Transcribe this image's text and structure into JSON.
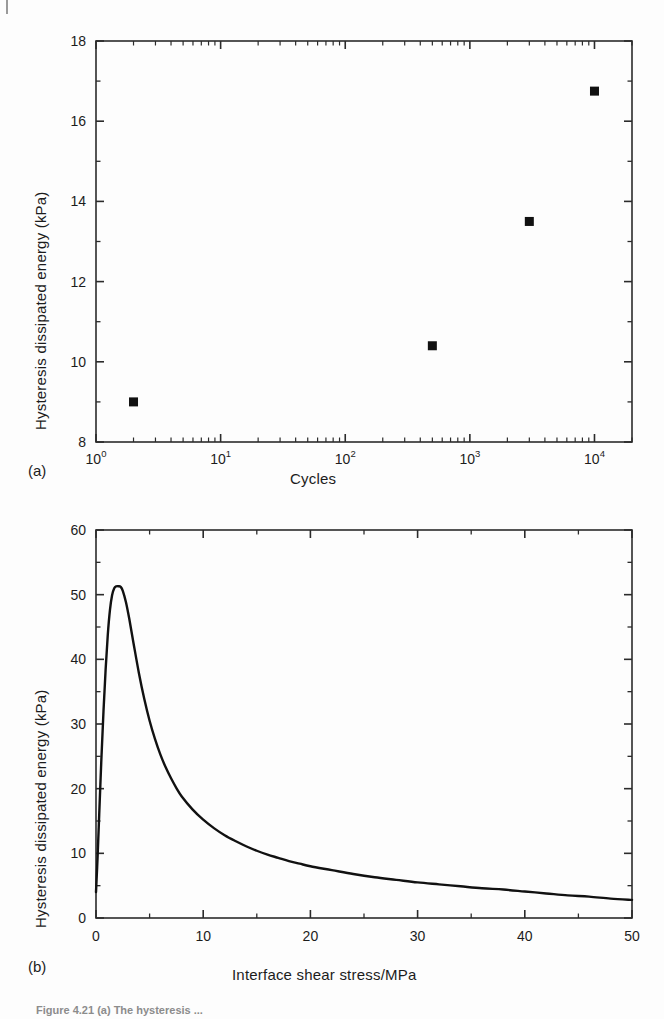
{
  "figure": {
    "caption_text": "Figure 4.21  (a) The hysteresis ...",
    "panel_a_letter": "(a)",
    "panel_b_letter": "(b)"
  },
  "chart_data": [
    {
      "type": "scatter",
      "panel": "(a)",
      "title": "",
      "xlabel": "Cycles",
      "ylabel": "Hysteresis dissipated energy (kPa)",
      "xscale": "log",
      "xlim": [
        1,
        20000
      ],
      "ylim": [
        8,
        18
      ],
      "yticks": [
        8,
        10,
        12,
        14,
        16,
        18
      ],
      "ytick_labels": [
        "8",
        "10",
        "12",
        "14",
        "16",
        "18"
      ],
      "xticks": [
        1,
        10,
        100,
        1000,
        10000
      ],
      "xtick_labels": [
        "10^0",
        "10^1",
        "10^2",
        "10^3",
        "10^4"
      ],
      "xtick_mantissa": [
        "10",
        "10",
        "10",
        "10",
        "10"
      ],
      "xtick_exponent": [
        "0",
        "1",
        "2",
        "3",
        "4"
      ],
      "grid": false,
      "legend": "none",
      "marker": "square",
      "marker_color": "#111111",
      "marker_size": 9,
      "points": [
        {
          "x": 2,
          "y": 9.0
        },
        {
          "x": 500,
          "y": 10.4
        },
        {
          "x": 3000,
          "y": 13.5
        },
        {
          "x": 10000,
          "y": 16.75
        }
      ]
    },
    {
      "type": "line",
      "panel": "(b)",
      "title": "",
      "xlabel": "Interface shear stress/MPa",
      "ylabel": "Hysteresis dissipated energy (kPa)",
      "xscale": "linear",
      "xlim": [
        0,
        50
      ],
      "ylim": [
        0,
        60
      ],
      "yticks": [
        0,
        10,
        20,
        30,
        40,
        50,
        60
      ],
      "ytick_labels": [
        "0",
        "10",
        "20",
        "30",
        "40",
        "50",
        "60"
      ],
      "xticks": [
        0,
        10,
        20,
        30,
        40,
        50
      ],
      "xtick_labels": [
        "0",
        "10",
        "20",
        "30",
        "40",
        "50"
      ],
      "grid": false,
      "legend": "none",
      "line_color": "#111111",
      "line_width": 2.4,
      "peak": {
        "x": 2.3,
        "y": 51.3
      },
      "series": [
        {
          "name": "hysteresis dissipated energy",
          "x": [
            0.0,
            0.15,
            0.3,
            0.5,
            0.7,
            0.9,
            1.1,
            1.3,
            1.5,
            1.7,
            1.9,
            2.1,
            2.3,
            2.5,
            2.8,
            3.1,
            3.5,
            4.0,
            4.5,
            5.0,
            5.5,
            6.0,
            6.5,
            7.0,
            7.5,
            8.0,
            9.0,
            10.0,
            11.0,
            12.0,
            13.0,
            14.0,
            15.0,
            16.0,
            17.0,
            18.0,
            19.0,
            20.0,
            22.0,
            24.0,
            26.0,
            28.0,
            30.0,
            32.0,
            34.0,
            36.0,
            38.0,
            40.0,
            42.0,
            44.0,
            46.0,
            48.0,
            50.0
          ],
          "y": [
            4.0,
            9.5,
            16.0,
            24.5,
            32.0,
            38.5,
            43.8,
            47.6,
            49.9,
            51.0,
            51.3,
            51.3,
            51.2,
            50.6,
            48.8,
            46.3,
            42.5,
            37.9,
            33.9,
            30.5,
            27.7,
            25.3,
            23.3,
            21.6,
            20.1,
            18.8,
            16.8,
            15.2,
            13.9,
            12.8,
            11.9,
            11.1,
            10.4,
            9.8,
            9.3,
            8.8,
            8.4,
            8.0,
            7.4,
            6.8,
            6.3,
            5.9,
            5.5,
            5.2,
            4.9,
            4.6,
            4.4,
            4.1,
            3.8,
            3.5,
            3.3,
            3.0,
            2.8
          ]
        }
      ]
    }
  ]
}
